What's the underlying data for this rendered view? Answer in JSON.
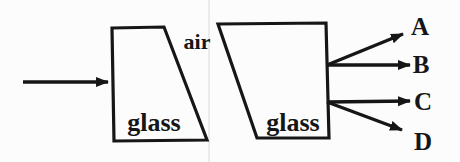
{
  "figure": {
    "type": "ray-diagram",
    "labels": {
      "air": "air",
      "left_block": "glass",
      "right_block": "glass",
      "ray_a": "A",
      "ray_b": "B",
      "ray_c": "C",
      "ray_d": "D"
    },
    "colors": {
      "ink": "#161616",
      "background": "#fcfcfc",
      "scan_line": "#ebebeb"
    }
  }
}
